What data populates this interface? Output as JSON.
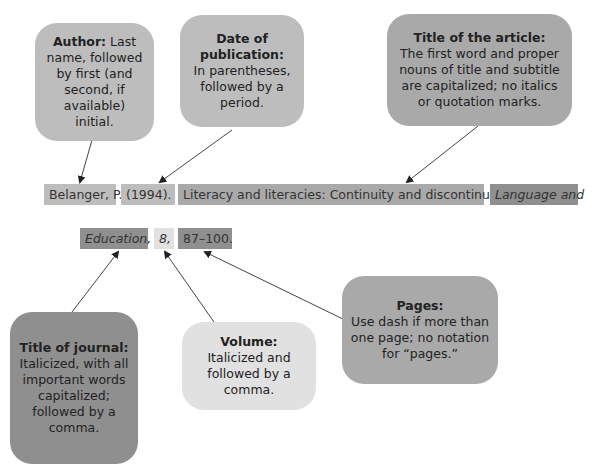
{
  "callouts": {
    "author": {
      "heading": "Author:",
      "body": "Last name, followed by first (and second, if available) initial."
    },
    "date": {
      "heading": "Date of publication:",
      "body": "In parentheses, followed by a period."
    },
    "article_title": {
      "heading": "Title of the article:",
      "body": "The first word and proper nouns of title and subtitle are capitalized; no italics or quotation marks."
    },
    "journal_title": {
      "heading": "Title of journal:",
      "body": "Italicized, with all important words capitalized; followed by a comma."
    },
    "volume": {
      "heading": "Volume:",
      "body": "Italicized and followed by a comma."
    },
    "pages": {
      "heading": "Pages:",
      "body": "Use dash if more than one page; no notation for “pages.”"
    }
  },
  "citation": {
    "author": "Belanger, P.",
    "year": "(1994).",
    "article_title": "Literacy and literacies: Continuity and discontinuity.",
    "journal_part1": "Language and",
    "journal_part2": "Education,",
    "volume": "8,",
    "pages": "87–100."
  },
  "colors": {
    "light_gray": "#bdbdbd",
    "mid_gray": "#a9a9a9",
    "dark_gray": "#8f8f8f",
    "pale_gray": "#e1e1e1"
  }
}
